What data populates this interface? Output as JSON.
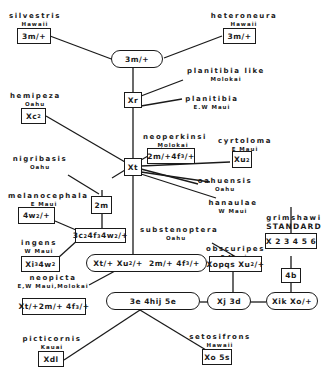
{
  "diagram": {
    "type": "chromosome-inversion phylogeny (Hawaiian Drosophila, grimshawi standard)",
    "nodes": {
      "root": "3m/+",
      "xr": "Xr",
      "xt": "Xt",
      "m2": "2m",
      "mel_anc": "3c²4f³4w²/+",
      "xt_anc": "Xt/+Xu²/+ 2m/+ 4f³/+",
      "e3": "3e 4hij 5e",
      "xj": "Xj 3d",
      "xik": "Xik Xo/+",
      "b4": "4b"
    },
    "species": [
      {
        "name": "silvestris",
        "location": "Hawaii",
        "karyotype": "3m/+"
      },
      {
        "name": "heteroneura",
        "location": "Hawaii",
        "karyotype": "3m/+"
      },
      {
        "name": "planitibia like",
        "location": "Molokai"
      },
      {
        "name": "planitibia",
        "location": "E.W Maui"
      },
      {
        "name": "hemipeza",
        "location": "Oahu",
        "karyotype": "Xc²"
      },
      {
        "name": "neoperkinsi",
        "location": "Molokai",
        "karyotype": "2m/+4f³/+"
      },
      {
        "name": "cyrtoloma",
        "location": "E Maui",
        "karyotype": "Xu²"
      },
      {
        "name": "nigribasis",
        "location": "Oahu"
      },
      {
        "name": "oahuensis",
        "location": "Oahu"
      },
      {
        "name": "hanaulae",
        "location": "W Maui"
      },
      {
        "name": "melanocephala",
        "location": "E Maui",
        "karyotype": "4w²/+"
      },
      {
        "name": "ingens",
        "location": "W Maui",
        "karyotype": "Xi³ 4w²"
      },
      {
        "name": "substenoptera",
        "location": "Oahu"
      },
      {
        "name": "obscuripes",
        "location": "E Maui",
        "karyotype": "Xopqs Xu²/+"
      },
      {
        "name": "neopicta",
        "location": "E,W Maui,Molokai",
        "karyotype": "Xt/+2m/+ 4f³/+"
      },
      {
        "name": "grimshawi",
        "location": "STANDARD",
        "karyotype": "X 2 3 4 5 6"
      },
      {
        "name": "picticornis",
        "location": "Kauai",
        "karyotype": "Xdl"
      },
      {
        "name": "setosifrons",
        "location": "Hawaii",
        "karyotype": "Xo 5s"
      }
    ]
  },
  "labels": {
    "silvestris": "silvestris",
    "silvestris_loc": "Hawaii",
    "heteroneura": "heteroneura",
    "heteroneura_loc": "Hawaii",
    "planlike": "planitibia like",
    "planlike_loc": "Molokai",
    "planitibia": "planitibia",
    "planitibia_loc": "E.W Maui",
    "hemipeza": "hemipeza",
    "hemipeza_loc": "Oahu",
    "neoperkinsi": "neoperkinsi",
    "neoperkinsi_loc": "Molokai",
    "cyrtoloma": "cyrtoloma",
    "cyrtoloma_loc": "E Maui",
    "nigribasis": "nigribasis",
    "nigribasis_loc": "Oahu",
    "oahuensis": "oahuensis",
    "oahuensis_loc": "Oahu",
    "hanaulae": "hanaulae",
    "hanaulae_loc": "W Maui",
    "melanocephala": "melanocephala",
    "melanocephala_loc": "E Maui",
    "ingens": "ingens",
    "ingens_loc": "W Maui",
    "substenoptera": "substenoptera",
    "substenoptera_loc": "Oahu",
    "obscuripes": "obscuripes",
    "obscuripes_loc": "E Maui",
    "neopicta": "neopicta",
    "neopicta_loc": "E,W Maui,Molokai",
    "grimshawi": "grimshawi",
    "grimshawi_loc": "STANDARD",
    "picticornis": "picticornis",
    "picticornis_loc": "Kauai",
    "setosifrons": "setosifrons",
    "setosifrons_loc": "Hawaii"
  },
  "boxes": {
    "silvestris": "3m/+",
    "heteroneura": "3m/+",
    "root": "3m/+",
    "xr": "Xr",
    "xt": "Xt",
    "m2": "2m",
    "xj": "Xj 3d",
    "b4": "4b",
    "xik": "Xik Xo/+",
    "e3": "3e 4hij 5e",
    "picticornis": "Xdl",
    "setosifrons": "Xo 5s",
    "grimshawi": "X 2 3 4 5 6"
  }
}
